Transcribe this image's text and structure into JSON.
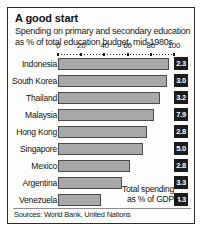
{
  "card": {
    "title": "A good start",
    "subtitle": "Spending on primary and secondary education as % of total education budget, mid-1980s",
    "source": "Sources: World Bank, United Nations",
    "annotation_line1": "Total spending",
    "annotation_line2": "as % of GDP",
    "bar_color": "#a8a8a8",
    "bar_border_color": "#4a4a4a",
    "badge_color": "#1c1c1c",
    "badge_text_color": "#ffffff",
    "frame_color": "#2b2b2b"
  },
  "chart_data": {
    "type": "bar",
    "orientation": "horizontal",
    "title": "A good start",
    "subtitle": "Spending on primary and secondary education as % of total education budget, mid-1980s",
    "xlabel": "",
    "ylabel": "",
    "xlim": [
      0,
      100
    ],
    "ticks": [
      0,
      20,
      40,
      60,
      80,
      100
    ],
    "tick_labels": [
      "0",
      "20",
      "40",
      "60",
      "80",
      "100"
    ],
    "grid": false,
    "legend": false,
    "categories": [
      "Indonesia",
      "South Korea",
      "Thailand",
      "Malaysia",
      "Hong Kong",
      "Singapore",
      "Mexico",
      "Argentina",
      "Venezuela"
    ],
    "series": [
      {
        "name": "Spending on primary and secondary education as % of total education budget",
        "values": [
          96,
          94,
          88,
          83,
          77,
          73,
          62,
          55,
          37
        ]
      }
    ],
    "badges": {
      "label": "Total spending as % of GDP",
      "values": [
        "2.3",
        "3.0",
        "3.2",
        "7.9",
        "2.8",
        "5.0",
        "2.8",
        "3.3",
        "4.3"
      ]
    },
    "source": "Sources: World Bank, United Nations"
  }
}
